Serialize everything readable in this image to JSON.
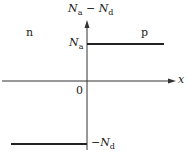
{
  "diagram": {
    "y_axis_label": {
      "main": "N",
      "sub1": "a",
      "minus": " − ",
      "main2": "N",
      "sub2": "d"
    },
    "x_axis_label": "x",
    "origin_label": "0",
    "region_left": "n",
    "region_right": "p",
    "level_acceptor": {
      "main": "N",
      "sub": "a"
    },
    "level_donor": {
      "prefix": "−",
      "main": "N",
      "sub": "d"
    }
  }
}
